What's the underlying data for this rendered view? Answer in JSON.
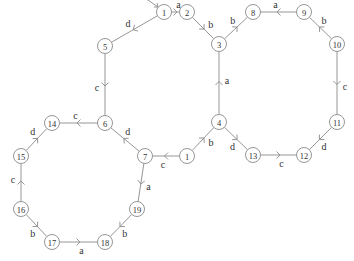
{
  "diagram": {
    "type": "directed-graph",
    "start_node": "1",
    "nodes": [
      {
        "id": "n1a",
        "label": "1"
      },
      {
        "id": "n2",
        "label": "2"
      },
      {
        "id": "n3",
        "label": "3"
      },
      {
        "id": "n4",
        "label": "4"
      },
      {
        "id": "n1b",
        "label": "1"
      },
      {
        "id": "n7",
        "label": "7"
      },
      {
        "id": "n6",
        "label": "6"
      },
      {
        "id": "n5",
        "label": "5"
      },
      {
        "id": "n8",
        "label": "8"
      },
      {
        "id": "n9",
        "label": "9"
      },
      {
        "id": "n10",
        "label": "10"
      },
      {
        "id": "n11",
        "label": "11"
      },
      {
        "id": "n12",
        "label": "12"
      },
      {
        "id": "n13",
        "label": "13"
      },
      {
        "id": "n14",
        "label": "14"
      },
      {
        "id": "n15",
        "label": "15"
      },
      {
        "id": "n16",
        "label": "16"
      },
      {
        "id": "n17",
        "label": "17"
      },
      {
        "id": "n18",
        "label": "18"
      },
      {
        "id": "n19",
        "label": "19"
      }
    ],
    "edges": [
      {
        "from": "n1a",
        "to": "n2",
        "label": "a"
      },
      {
        "from": "n2",
        "to": "n3",
        "label": "b"
      },
      {
        "from": "n4",
        "to": "n3",
        "label": "a"
      },
      {
        "from": "n1b",
        "to": "n4",
        "label": "b"
      },
      {
        "from": "n1b",
        "to": "n7",
        "label": "c"
      },
      {
        "from": "n7",
        "to": "n6",
        "label": "d"
      },
      {
        "from": "n5",
        "to": "n6",
        "label": "c"
      },
      {
        "from": "n1a",
        "to": "n5",
        "label": "d"
      },
      {
        "from": "n3",
        "to": "n8",
        "label": "b"
      },
      {
        "from": "n9",
        "to": "n8",
        "label": "a"
      },
      {
        "from": "n10",
        "to": "n9",
        "label": "b"
      },
      {
        "from": "n10",
        "to": "n11",
        "label": "c"
      },
      {
        "from": "n11",
        "to": "n12",
        "label": "d"
      },
      {
        "from": "n13",
        "to": "n12",
        "label": "c"
      },
      {
        "from": "n4",
        "to": "n13",
        "label": "d"
      },
      {
        "from": "n6",
        "to": "n14",
        "label": "c"
      },
      {
        "from": "n15",
        "to": "n14",
        "label": "d"
      },
      {
        "from": "n16",
        "to": "n15",
        "label": "c"
      },
      {
        "from": "n16",
        "to": "n17",
        "label": "b"
      },
      {
        "from": "n17",
        "to": "n18",
        "label": "a"
      },
      {
        "from": "n19",
        "to": "n18",
        "label": "b"
      },
      {
        "from": "n7",
        "to": "n19",
        "label": "a"
      }
    ]
  }
}
